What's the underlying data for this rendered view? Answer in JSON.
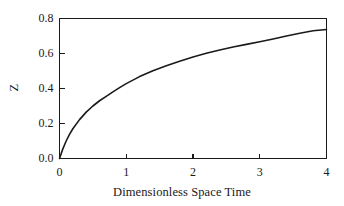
{
  "chart_data": {
    "type": "line",
    "title": "",
    "subtitle": "",
    "xlabel": "Dimensionless Space Time",
    "ylabel": "Z",
    "xlim": [
      0,
      4
    ],
    "ylim": [
      0,
      0.8
    ],
    "xticks": [
      0,
      1,
      2,
      3,
      4
    ],
    "xticklabels": [
      "0",
      "1",
      "2",
      "3",
      "4"
    ],
    "yticks": [
      0.0,
      0.2,
      0.4,
      0.6,
      0.8
    ],
    "yticklabels": [
      "0.0",
      "0.2",
      "0.4",
      "0.6",
      "0.8"
    ],
    "grid": false,
    "legend": null,
    "line_color": "#1a1a1a",
    "line_width": 1.6,
    "background": "#ffffff",
    "frame": "box",
    "tick_direction": "in",
    "series": [
      {
        "name": "Z",
        "x": [
          0.0,
          0.05,
          0.1,
          0.15,
          0.2,
          0.3,
          0.4,
          0.5,
          0.6,
          0.7,
          0.8,
          0.9,
          1.0,
          1.2,
          1.4,
          1.6,
          1.8,
          2.0,
          2.2,
          2.4,
          2.6,
          2.8,
          3.0,
          3.2,
          3.4,
          3.6,
          3.8,
          4.0
        ],
        "y": [
          0.0,
          0.055,
          0.1,
          0.138,
          0.17,
          0.222,
          0.265,
          0.3,
          0.33,
          0.355,
          0.381,
          0.405,
          0.428,
          0.468,
          0.502,
          0.53,
          0.556,
          0.58,
          0.601,
          0.62,
          0.637,
          0.652,
          0.667,
          0.683,
          0.7,
          0.716,
          0.73,
          0.737
        ]
      }
    ]
  },
  "axes": {
    "xlabel_text": "Dimensionless Space Time",
    "ylabel_text": "Z"
  }
}
